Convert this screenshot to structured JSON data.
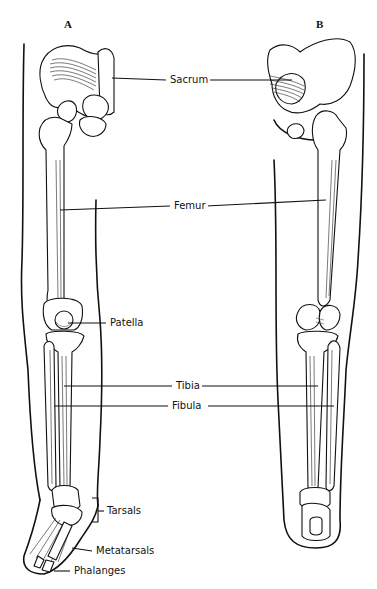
{
  "figure": {
    "panels": [
      {
        "id": "A",
        "label": "A",
        "view": "anterior"
      },
      {
        "id": "B",
        "label": "B",
        "view": "posterior"
      }
    ],
    "labels": {
      "sacrum": "Sacrum",
      "femur": "Femur",
      "patella": "Patella",
      "tibia": "Tibia",
      "fibula": "Fibula",
      "tarsals": "Tarsals",
      "metatarsals": "Metatarsals",
      "phalanges": "Phalanges"
    },
    "colors": {
      "ink": "#111111",
      "background": "#ffffff"
    }
  }
}
